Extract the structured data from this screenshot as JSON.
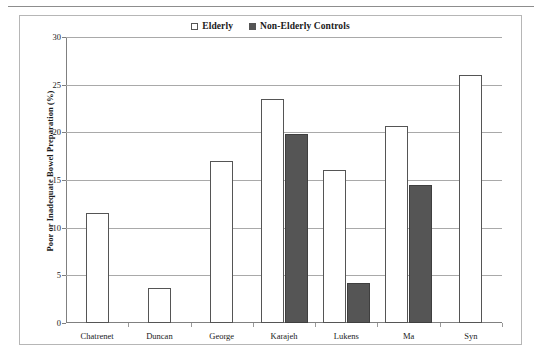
{
  "chart_data": {
    "type": "bar",
    "title": "",
    "subtitle": "",
    "xlabel": "",
    "ylabel": "Poor or Inadequate Bowel Preparation (%)",
    "ylim": [
      0,
      30
    ],
    "ytick_labels": [
      "0",
      "5",
      "10",
      "15",
      "20",
      "25",
      "30"
    ],
    "ytick_values": [
      0,
      5,
      10,
      15,
      20,
      25,
      30
    ],
    "grid": true,
    "legend_position": "top-center",
    "categories": [
      "Chatrenet",
      "Duncan",
      "George",
      "Karajeh",
      "Lukens",
      "Ma",
      "Syn"
    ],
    "series": [
      {
        "name": "Elderly",
        "color": "#ffffff",
        "edge_color": "#555555",
        "values": [
          11.5,
          3.7,
          17.0,
          23.5,
          16.1,
          20.7,
          26.0
        ]
      },
      {
        "name": "Non-Elderly Controls",
        "color": "#555555",
        "edge_color": "#3f3f3f",
        "values": [
          null,
          null,
          null,
          19.8,
          4.2,
          14.5,
          null
        ]
      }
    ]
  },
  "legend": {
    "items": [
      {
        "label": "Elderly",
        "swatch": "open-square"
      },
      {
        "label": "Non-Elderly Controls",
        "swatch": "filled-square"
      }
    ]
  },
  "colors": {
    "series_elderly": "#ffffff",
    "series_control": "#555555",
    "gridline": "#a9a9a9",
    "axis": "#808080",
    "frame": "#b6b6b6"
  }
}
